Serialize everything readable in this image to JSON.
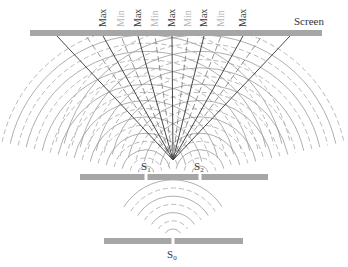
{
  "colors": {
    "barrier": "#a6a6a6",
    "wave_solid": "#9a9a9a",
    "wave_dashed": "#a8a8a8",
    "max_line": "#333333",
    "min_line": "#6a6a6a",
    "max_label": "#3a3a3a",
    "min_label": "#b8b8b8"
  },
  "screen": {
    "label": "Screen",
    "x1": 30,
    "x2": 322,
    "y": 30,
    "h": 6
  },
  "slit_barrier": {
    "x1": 80,
    "x2": 268,
    "y": 174,
    "h": 6
  },
  "source_barrier": {
    "x1": 104,
    "x2": 243,
    "y": 238,
    "h": 6
  },
  "sources": {
    "s0": {
      "label": "S",
      "sub": "0",
      "x": 173
    },
    "s1": {
      "label": "S",
      "sub": "1",
      "x": 146
    },
    "s2": {
      "label": "S",
      "sub": "2",
      "x": 200
    }
  },
  "fringe_labels": [
    {
      "text": "Max",
      "type": "max",
      "x": 103
    },
    {
      "text": "Min",
      "type": "min",
      "x": 121
    },
    {
      "text": "Max",
      "type": "max",
      "x": 138
    },
    {
      "text": "Min",
      "type": "min",
      "x": 155
    },
    {
      "text": "Max",
      "type": "max",
      "x": 172
    },
    {
      "text": "Min",
      "type": "min",
      "x": 188
    },
    {
      "text": "Max",
      "type": "max",
      "x": 204
    },
    {
      "text": "Min",
      "type": "min",
      "x": 221
    },
    {
      "text": "Max",
      "type": "max",
      "x": 243
    }
  ],
  "fringe_lines_screen_x": [
    57,
    86,
    103,
    121,
    138,
    155,
    172,
    188,
    204,
    221,
    243,
    262,
    290
  ],
  "fringe_lines_type": [
    "max",
    "min",
    "max",
    "min",
    "max",
    "min",
    "max",
    "min",
    "max",
    "min",
    "max",
    "min",
    "max"
  ]
}
